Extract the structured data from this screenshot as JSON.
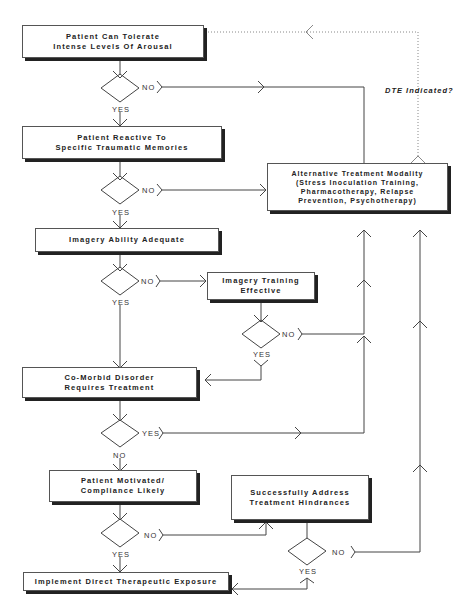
{
  "nodes": {
    "tolerate": "Patient Can Tolerate\nIntense Levels Of Arousal",
    "reactive": "Patient Reactive To\nSpecific Traumatic Memories",
    "imagery": "Imagery Ability Adequate",
    "training": "Imagery Training\nEffective",
    "comorbid": "Co-Morbid Disorder\nRequires Treatment",
    "motivated": "Patient Motivated/\nCompliance Likely",
    "hindrances": "Successfully Address\nTreatment Hindrances",
    "implement": "Implement Direct Therapeutic Exposure",
    "alternative": "Alternative Treatment Modality\n(Stress Inoculation Training,\nPharmacotherapy, Relapse\nPrevention, Psychotherapy)"
  },
  "labels": {
    "yes": "YES",
    "no": "NO",
    "dte_indicated": "DTE Indicated?"
  }
}
